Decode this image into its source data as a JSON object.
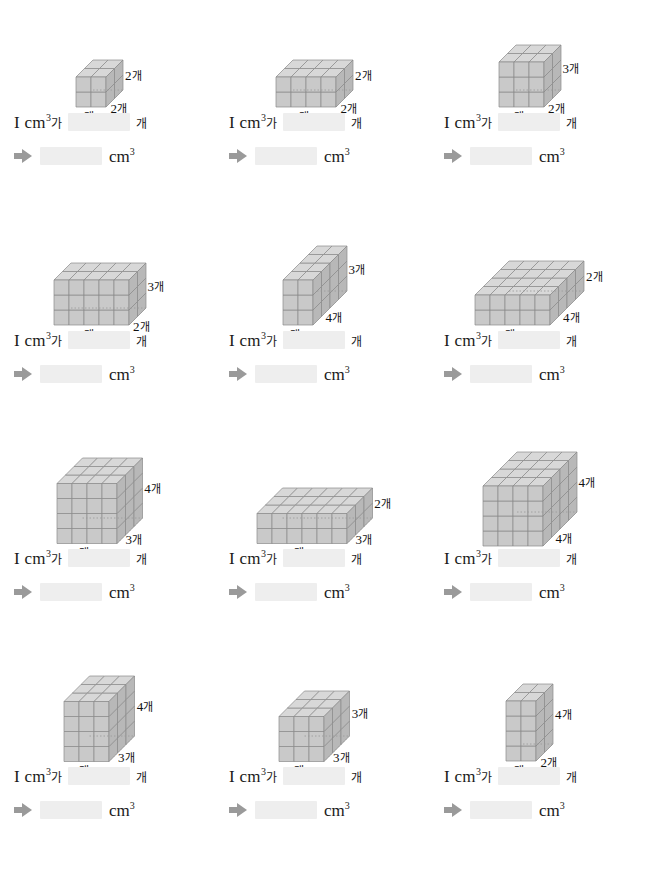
{
  "page": {
    "unit_text": "cm",
    "unit_sup": "3",
    "counter_word": "개",
    "particle": "가",
    "blank_placeholder": ""
  },
  "labels": {
    "line1_prefix": "I cm",
    "line1_sup": "3",
    "line1_particle": "가",
    "line1_suffix": "개",
    "line2_unit": "cm",
    "line2_sup": "3",
    "arrow_icon": "arrow-right-icon"
  },
  "problems": [
    {
      "id": 1,
      "width": 2,
      "depth": 2,
      "height": 2,
      "dims": [
        {
          "text": "2개",
          "pos": "front-left"
        },
        {
          "text": "2개",
          "pos": "front-right"
        },
        {
          "text": "2개",
          "pos": "right"
        }
      ],
      "cube_count_answer": "",
      "volume_answer": ""
    },
    {
      "id": 2,
      "width": 4,
      "depth": 2,
      "height": 2,
      "dims": [
        {
          "text": "4개",
          "pos": "front-left"
        },
        {
          "text": "2개",
          "pos": "front-right"
        },
        {
          "text": "2개",
          "pos": "right"
        }
      ],
      "cube_count_answer": "",
      "volume_answer": ""
    },
    {
      "id": 3,
      "width": 3,
      "depth": 2,
      "height": 3,
      "dims": [
        {
          "text": "3개",
          "pos": "front-left"
        },
        {
          "text": "2개",
          "pos": "front-right"
        },
        {
          "text": "3개",
          "pos": "right"
        }
      ],
      "cube_count_answer": "",
      "volume_answer": ""
    },
    {
      "id": 4,
      "width": 5,
      "depth": 2,
      "height": 3,
      "dims": [
        {
          "text": "5개",
          "pos": "front-left"
        },
        {
          "text": "2개",
          "pos": "front-right"
        },
        {
          "text": "3개",
          "pos": "right"
        }
      ],
      "cube_count_answer": "",
      "volume_answer": ""
    },
    {
      "id": 5,
      "width": 2,
      "depth": 4,
      "height": 3,
      "dims": [
        {
          "text": "2개",
          "pos": "front-left"
        },
        {
          "text": "4개",
          "pos": "front-right"
        },
        {
          "text": "3개",
          "pos": "right"
        }
      ],
      "cube_count_answer": "",
      "volume_answer": ""
    },
    {
      "id": 6,
      "width": 5,
      "depth": 4,
      "height": 2,
      "dims": [
        {
          "text": "5개",
          "pos": "front-left"
        },
        {
          "text": "4개",
          "pos": "front-right"
        },
        {
          "text": "2개",
          "pos": "right"
        }
      ],
      "cube_count_answer": "",
      "volume_answer": ""
    },
    {
      "id": 7,
      "width": 4,
      "depth": 3,
      "height": 4,
      "dims": [
        {
          "text": "4개",
          "pos": "front-left"
        },
        {
          "text": "3개",
          "pos": "front-right"
        },
        {
          "text": "4개",
          "pos": "right"
        }
      ],
      "cube_count_answer": "",
      "volume_answer": ""
    },
    {
      "id": 8,
      "width": 6,
      "depth": 3,
      "height": 2,
      "dims": [
        {
          "text": "6개",
          "pos": "front-left"
        },
        {
          "text": "3개",
          "pos": "front-right"
        },
        {
          "text": "2개",
          "pos": "right"
        }
      ],
      "cube_count_answer": "",
      "volume_answer": ""
    },
    {
      "id": 9,
      "width": 4,
      "depth": 4,
      "height": 4,
      "dims": [
        {
          "text": "4개",
          "pos": "front-left"
        },
        {
          "text": "4개",
          "pos": "front-right"
        },
        {
          "text": "4개",
          "pos": "right"
        }
      ],
      "cube_count_answer": "",
      "volume_answer": ""
    },
    {
      "id": 10,
      "width": 3,
      "depth": 3,
      "height": 4,
      "dims": [
        {
          "text": "3개",
          "pos": "front-left"
        },
        {
          "text": "3개",
          "pos": "front-right"
        },
        {
          "text": "4개",
          "pos": "right"
        }
      ],
      "cube_count_answer": "",
      "volume_answer": ""
    },
    {
      "id": 11,
      "width": 3,
      "depth": 3,
      "height": 3,
      "dims": [
        {
          "text": "3개",
          "pos": "front-left"
        },
        {
          "text": "3개",
          "pos": "front-right"
        },
        {
          "text": "3개",
          "pos": "right"
        }
      ],
      "cube_count_answer": "",
      "volume_answer": ""
    },
    {
      "id": 12,
      "width": 2,
      "depth": 2,
      "height": 4,
      "dims": [
        {
          "text": "2개",
          "pos": "front-left"
        },
        {
          "text": "2개",
          "pos": "front-right"
        },
        {
          "text": "4개",
          "pos": "right"
        }
      ],
      "cube_count_answer": "",
      "volume_answer": ""
    }
  ],
  "colors": {
    "cube_top": "#d8d8d8",
    "cube_front": "#c9c9c9",
    "cube_side": "#b8b8b8",
    "edge": "#8a8a8a",
    "blank_fill": "#eeeeee",
    "arrow": "#9a9a9a"
  }
}
